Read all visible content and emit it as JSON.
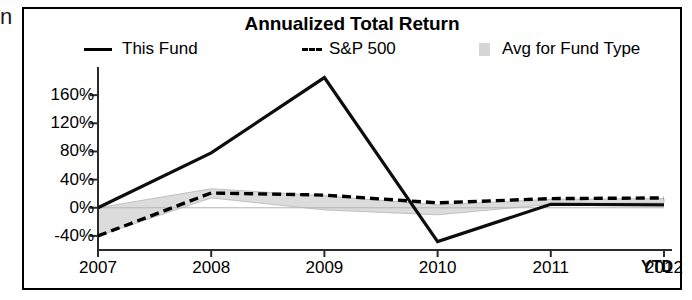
{
  "edge_glyph": "n",
  "panel": {
    "title": "Annualized Total Return"
  },
  "legend": {
    "items": [
      {
        "label": "This Fund",
        "marker": "solid-line-swatch",
        "color": "#000000"
      },
      {
        "label": "S&P 500",
        "marker": "dashed-line-swatch",
        "color": "#000000"
      },
      {
        "label": "Avg for Fund Type",
        "marker": "gray-block-swatch",
        "color": "#d6d6d6"
      }
    ]
  },
  "axes": {
    "y_ticks": [
      "160%",
      "120%",
      "80%",
      "40%",
      "0%",
      "-40%"
    ],
    "x_ticks": [
      "2007",
      "2008",
      "2009",
      "2010",
      "2011",
      "2012"
    ],
    "x_suffix": "YTD"
  },
  "chart_data": {
    "type": "line",
    "title": "Annualized Total Return",
    "xlabel": "",
    "ylabel": "",
    "grid": false,
    "legend_position": "top",
    "categories": [
      "2007",
      "2008",
      "2009",
      "2010",
      "2011",
      "2012 YTD"
    ],
    "x": [
      2007,
      2008,
      2009,
      2010,
      2011,
      2012
    ],
    "ylim": [
      -60,
      200
    ],
    "y_ticks": [
      -40,
      0,
      40,
      80,
      120,
      160
    ],
    "series": [
      {
        "name": "This Fund",
        "style": "solid",
        "color": "#000000",
        "values": [
          0,
          78,
          185,
          -48,
          5,
          4
        ]
      },
      {
        "name": "S&P 500",
        "style": "dashed",
        "color": "#000000",
        "values": [
          -40,
          21,
          18,
          7,
          13,
          14
        ]
      },
      {
        "name": "Avg for Fund Type",
        "style": "band",
        "color": "#d6d6d6",
        "band_upper": [
          0,
          27,
          17,
          4,
          12,
          13
        ],
        "band_lower": [
          -40,
          14,
          -3,
          -10,
          5,
          7
        ]
      }
    ]
  }
}
